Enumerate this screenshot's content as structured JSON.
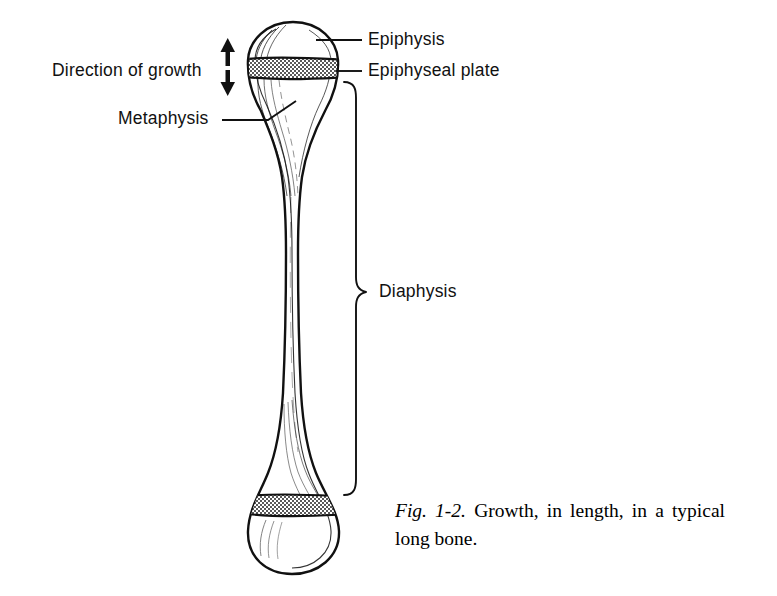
{
  "figure": {
    "id": "fig-1-2",
    "caption_number": "Fig. 1-2.",
    "caption_text": "Growth, in length, in a typical long bone.",
    "background_color": "#ffffff",
    "ink_color": "#111111"
  },
  "labels": {
    "epiphysis": "Epiphysis",
    "epiphyseal_plate": "Epiphyseal plate",
    "diaphysis": "Diaphysis",
    "direction_of_growth": "Direction of growth",
    "metaphysis": "Metaphysis"
  },
  "diagram": {
    "subject": "typical long bone",
    "structures": [
      {
        "name": "proximal epiphysis",
        "region": "top rounded head"
      },
      {
        "name": "proximal epiphyseal plate",
        "region": "hatched band below top head"
      },
      {
        "name": "metaphysis",
        "region": "flared taper below epiphyseal plate"
      },
      {
        "name": "diaphysis",
        "region": "narrow central shaft"
      },
      {
        "name": "distal epiphyseal plate",
        "region": "hatched band above bottom head"
      },
      {
        "name": "distal epiphysis",
        "region": "bottom rounded head"
      }
    ],
    "growth_arrows": {
      "count": 2,
      "directions": [
        "up",
        "down"
      ],
      "meaning": "Direction of growth"
    },
    "brace": {
      "spans": "Diaphysis",
      "side": "right"
    },
    "plate_fill": "#7a7a7a",
    "outline_color": "#111111"
  }
}
